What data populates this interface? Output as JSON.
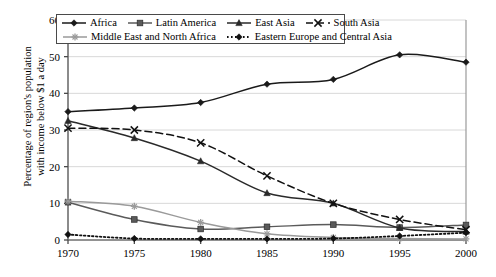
{
  "chart_data": {
    "type": "line",
    "title": "",
    "xlabel": "",
    "ylabel": "Percentage of region's population\nwith income below $1 a day",
    "x": [
      1970,
      1975,
      1980,
      1985,
      1990,
      1995,
      2000
    ],
    "xticklabels": [
      "1970",
      "1975",
      "1980",
      "1985",
      "1990",
      "1995",
      "2000"
    ],
    "yticklabels": [
      "0",
      "10",
      "20",
      "30",
      "40",
      "50",
      "60"
    ],
    "yticks": [
      0,
      10,
      20,
      30,
      40,
      50,
      60
    ],
    "xlim": [
      1970,
      2000
    ],
    "ylim": [
      0,
      60
    ],
    "grid": true,
    "grid_axis": "y",
    "legend_position": "top-left-inside",
    "series": [
      {
        "name": "Africa",
        "marker": "diamond",
        "dash": "solid",
        "color": "#1a1a1a",
        "values": [
          35.0,
          36.0,
          37.5,
          42.5,
          43.8,
          50.5,
          48.5
        ]
      },
      {
        "name": "Latin America",
        "marker": "square",
        "dash": "solid",
        "color": "#5a5a5a",
        "values": [
          10.3,
          5.6,
          3.0,
          3.6,
          4.2,
          3.4,
          4.1
        ]
      },
      {
        "name": "East Asia",
        "marker": "triangle",
        "dash": "solid",
        "color": "#2a2a2a",
        "values": [
          32.5,
          27.8,
          21.5,
          12.8,
          10.0,
          3.3,
          2.3
        ]
      },
      {
        "name": "South Asia",
        "marker": "x-cross",
        "dash": "dashed",
        "color": "#111111",
        "values": [
          30.5,
          30.0,
          26.5,
          17.5,
          10.0,
          5.6,
          2.8
        ]
      },
      {
        "name": "Middle East and North Africa",
        "marker": "asterisk",
        "dash": "solid",
        "color": "#9a9a9a",
        "values": [
          10.6,
          9.2,
          4.8,
          1.7,
          0.7,
          0.4,
          0.3
        ]
      },
      {
        "name": "Eastern Europe and Central Asia",
        "marker": "diamond",
        "dash": "dotted",
        "color": "#111111",
        "values": [
          1.5,
          0.4,
          0.3,
          0.3,
          0.4,
          1.1,
          2.0
        ]
      }
    ]
  },
  "axes": {
    "y_axis_title": "Percentage of region's population with income below $1 a day"
  }
}
